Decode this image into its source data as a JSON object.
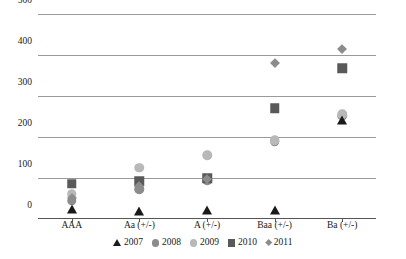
{
  "chart_data": {
    "type": "scatter",
    "title": "",
    "xlabel": "",
    "ylabel": "",
    "ylim": [
      0,
      500
    ],
    "yticks": [
      0,
      100,
      200,
      300,
      400,
      500
    ],
    "grid": true,
    "legend_position": "bottom",
    "categories": [
      "AAA",
      "Aa (+/-)",
      "A (+/-)",
      "Baa (+/-)",
      "Ba (+/-)"
    ],
    "series": [
      {
        "name": "2007",
        "marker": "triangle",
        "color": "#1a1a1a",
        "values": [
          28,
          22,
          24,
          25,
          245
        ]
      },
      {
        "name": "2008",
        "marker": "circle",
        "color": "#8c8c8c",
        "values": [
          45,
          72,
          95,
          190,
          252
        ]
      },
      {
        "name": "2009",
        "marker": "circle",
        "color": "#b8b8b8",
        "values": [
          60,
          125,
          155,
          192,
          255
        ]
      },
      {
        "name": "2010",
        "marker": "square",
        "color": "#595959",
        "values": [
          86,
          92,
          100,
          270,
          368
        ]
      },
      {
        "name": "2011",
        "marker": "diamond",
        "color": "#8c8c8c",
        "values": [
          52,
          80,
          98,
          380,
          415
        ]
      }
    ]
  },
  "axis": {
    "y_labels": [
      "500",
      "400",
      "300",
      "200",
      "100",
      "0"
    ],
    "x_labels": [
      "AAA",
      "Aa (+/-)",
      "A (+/-)",
      "Baa (+/-)",
      "Ba (+/-)"
    ]
  },
  "legend": {
    "items": [
      {
        "label": "2007",
        "marker": "triangle",
        "color": "#1a1a1a"
      },
      {
        "label": "2008",
        "marker": "circle",
        "color": "#8c8c8c"
      },
      {
        "label": "2009",
        "marker": "circle",
        "color": "#b8b8b8"
      },
      {
        "label": "2010",
        "marker": "square",
        "color": "#595959"
      },
      {
        "label": "2011",
        "marker": "diamond",
        "color": "#8c8c8c"
      }
    ]
  },
  "colors": {
    "gridline": "#9a9a9a",
    "axis": "#555555",
    "background": "#ffffff",
    "text": "#1a1a1a"
  }
}
